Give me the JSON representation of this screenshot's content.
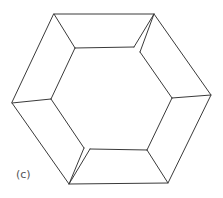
{
  "figure": {
    "label": "(c)",
    "stroke_color": "#3a3a3a",
    "outer_hexagon": [
      [
        54,
        14
      ],
      [
        154,
        14
      ],
      [
        211,
        95
      ],
      [
        168,
        183
      ],
      [
        69,
        184
      ],
      [
        12,
        103
      ]
    ],
    "inner_edges": [
      [
        [
          75,
          48
        ],
        [
          134,
          47
        ]
      ],
      [
        [
          75,
          48
        ],
        [
          51,
          99
        ]
      ],
      [
        [
          51,
          99
        ],
        [
          84,
          148
        ]
      ],
      [
        [
          90,
          149
        ],
        [
          147,
          150
        ]
      ],
      [
        [
          147,
          150
        ],
        [
          172,
          98
        ]
      ],
      [
        [
          172,
          98
        ],
        [
          140,
          52
        ]
      ]
    ],
    "connector_edges": [
      [
        [
          54,
          14
        ],
        [
          75,
          48
        ]
      ],
      [
        [
          154,
          14
        ],
        [
          134,
          47
        ]
      ],
      [
        [
          154,
          14
        ],
        [
          140,
          52
        ]
      ],
      [
        [
          211,
          95
        ],
        [
          172,
          98
        ]
      ],
      [
        [
          168,
          183
        ],
        [
          147,
          150
        ]
      ],
      [
        [
          69,
          184
        ],
        [
          90,
          149
        ]
      ],
      [
        [
          69,
          184
        ],
        [
          84,
          148
        ]
      ],
      [
        [
          12,
          103
        ],
        [
          51,
          99
        ]
      ]
    ]
  }
}
